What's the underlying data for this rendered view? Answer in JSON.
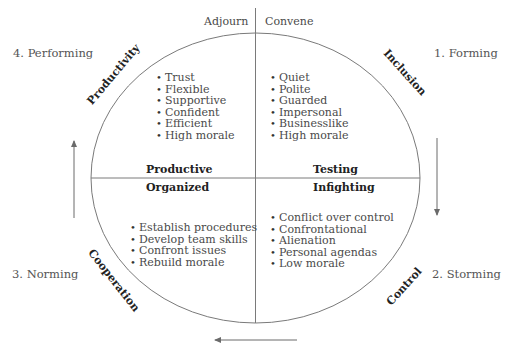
{
  "top_labels": {
    "left": "Adjourn",
    "right": "Convene"
  },
  "stages": {
    "forming": "1. Forming",
    "storming": "2. Storming",
    "norming": "3. Norming",
    "performing": "4. Performing"
  },
  "arc_labels": {
    "inclusion": "Inclusion",
    "control": "Control",
    "cooperation": "Cooperation",
    "productivity": "Productivity"
  },
  "quadrants": {
    "top_left": {
      "heading": "Productive",
      "items": [
        "Trust",
        "Flexible",
        "Supportive",
        "Confident",
        "Efficient",
        "High morale"
      ]
    },
    "top_right": {
      "heading": "Testing",
      "items": [
        "Quiet",
        "Polite",
        "Guarded",
        "Impersonal",
        "Businesslike",
        "High morale"
      ]
    },
    "bottom_left": {
      "heading": "Organized",
      "items": [
        "Establish procedures",
        "Develop team skills",
        "Confront issues",
        "Rebuild morale"
      ]
    },
    "bottom_right": {
      "heading": "Infighting",
      "items": [
        "Conflict over control",
        "Confrontational",
        "Alienation",
        "Personal agendas",
        "Low morale"
      ]
    }
  },
  "arrows": {
    "right": "down",
    "bottom": "left",
    "left": "up"
  },
  "colors": {
    "line": "#7a7a7a",
    "text": "#4a4a4a",
    "heading": "#222222"
  }
}
